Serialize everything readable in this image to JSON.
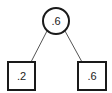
{
  "diagram": {
    "type": "tree",
    "root": {
      "label": ".6",
      "shape": "circle"
    },
    "children": [
      {
        "label": ".2",
        "shape": "square"
      },
      {
        "label": ".6",
        "shape": "square"
      }
    ],
    "colors": {
      "stroke": "#1a1a1a",
      "edge": "#555555",
      "fill": "#ffffff"
    }
  }
}
